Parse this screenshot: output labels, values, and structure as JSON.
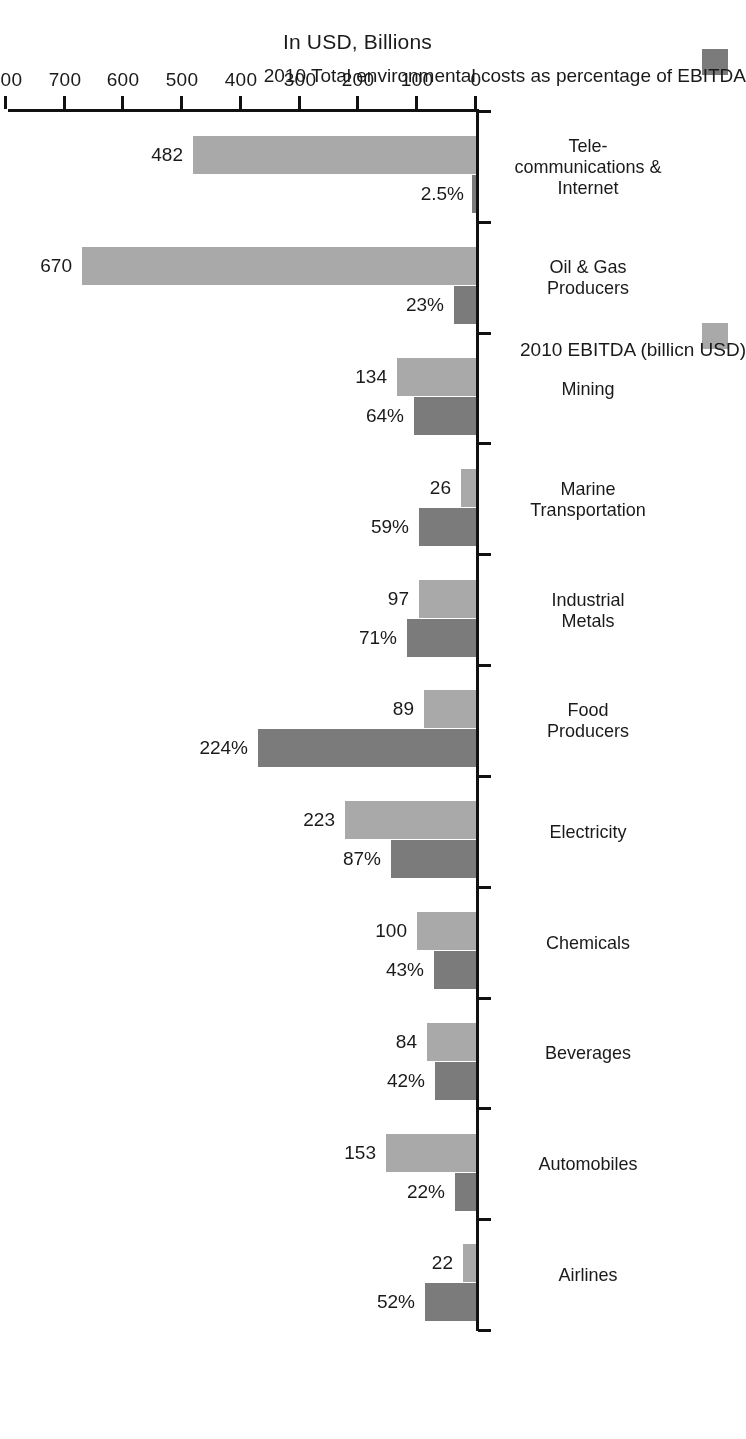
{
  "chart_data": {
    "type": "bar",
    "orientation": "horizontal",
    "title": "",
    "xlabel": "In USD, Billions",
    "ylabel": "",
    "xlim": [
      0,
      800
    ],
    "xticks": [
      "0",
      "100",
      "200",
      "300",
      "400",
      "500",
      "600",
      "700",
      "800"
    ],
    "grid": false,
    "legend_position": "bottom-right",
    "categories": [
      "Airlines",
      "Automobiles",
      "Beverages",
      "Chemicals",
      "Electricity",
      "Food Producers",
      "Industrial Metals",
      "Marine Transportation",
      "Mining",
      "Oil & Gas Producers",
      "Tele-communications & Internet"
    ],
    "series": [
      {
        "name": "2010 EBITDA (billicn USD)",
        "color": "#a9a9a9",
        "unit": "USD billions",
        "values": [
          22,
          153,
          84,
          100,
          223,
          89,
          97,
          26,
          134,
          670,
          482
        ],
        "labels": [
          "22",
          "153",
          "84",
          "100",
          "223",
          "89",
          "97",
          "26",
          "134",
          "670",
          "482"
        ]
      },
      {
        "name": "2010 Total environmental costs as percentage of EBITDA",
        "color": "#7b7b7b",
        "unit": "percent of EBITDA",
        "values": [
          52,
          22,
          42,
          43,
          87,
          224,
          71,
          59,
          64,
          23,
          2.5
        ],
        "labels": [
          "52%",
          "22%",
          "42%",
          "43%",
          "87%",
          "224%",
          "71%",
          "59%",
          "64%",
          "23%",
          "2.5%"
        ]
      }
    ]
  },
  "axis": {
    "value_axis_title": "In USD, Billions"
  },
  "legend": {
    "items": [
      {
        "label": "2010 EBITDA (billicn USD)",
        "color": "#a9a9a9",
        "swatch": "legend-swatch-ebitda"
      },
      {
        "label": "2010 Total environmental costs as percentage of EBITDA",
        "color": "#7b7b7b",
        "swatch": "legend-swatch-env"
      }
    ]
  }
}
